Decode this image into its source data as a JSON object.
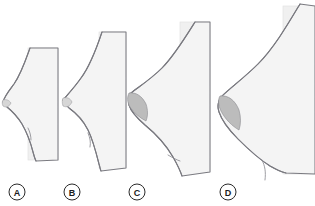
{
  "figure": {
    "width": 315,
    "height": 206,
    "background_color": "#ffffff"
  },
  "colors": {
    "panel_fill": "#f0f0f0",
    "panel_edge": "#e2e2e2",
    "contour_fill": "#f4f4f4",
    "contour_stroke": "#7a7a80",
    "areola_fill": "#bcbcbc",
    "areola_faint_fill": "#d6d6d6",
    "label_stroke": "#2a2a2a",
    "label_text": "#1c1c1c"
  },
  "labels": [
    {
      "id": "A",
      "text": "A",
      "cx": 17,
      "cy": 192,
      "r": 8
    },
    {
      "id": "B",
      "text": "B",
      "cx": 72,
      "cy": 192,
      "r": 8
    },
    {
      "id": "C",
      "text": "C",
      "cx": 137,
      "cy": 192,
      "r": 8
    },
    {
      "id": "D",
      "text": "D",
      "cx": 228,
      "cy": 192,
      "r": 8
    }
  ],
  "figures": [
    {
      "id": "A",
      "label": "A",
      "name": "breast-profile-a",
      "size_rank": 1,
      "projection": "minimal",
      "areola_shading": "very-faint",
      "panel": {
        "x": 28,
        "y": 48,
        "width": 30,
        "height": 112
      },
      "contour_path": "M 30 48 C 25 62 21 74 14 84 C 8 92 4 97 3 102 C 4 104 5 105 7 107 C 12 111 17 116 22 124 C 26 131 30 140 33 152 C 34 156 35 159 36 161",
      "areola_path": "M 3 100 C 6 99 9 100 11 103 C 9 107 6 108 3 106 C 2 104 2 102 3 100 Z",
      "fold_path": "M 28 128 C 30 132 31 136 31 140"
    },
    {
      "id": "B",
      "label": "B",
      "name": "breast-profile-b",
      "size_rank": 2,
      "projection": "small",
      "areola_shading": "faint",
      "panel": {
        "x": 99,
        "y": 32,
        "width": 27,
        "height": 136
      },
      "contour_path": "M 102 32 C 96 50 90 66 81 78 C 74 88 68 94 63 100 C 64 103 66 105 69 108 C 76 113 83 120 88 130 C 93 140 96 152 99 164 C 100 167 100 169 101 171",
      "areola_path": "M 63 98 C 67 97 70 98 72 102 C 70 106 67 108 63 106 C 62 103 62 100 63 98 Z",
      "fold_path": "M 88 133 C 90 138 91 142 90 147"
    },
    {
      "id": "C",
      "label": "C",
      "name": "breast-profile-c",
      "size_rank": 3,
      "projection": "moderate",
      "areola_shading": "pronounced",
      "panel": {
        "x": 180,
        "y": 22,
        "width": 30,
        "height": 150
      },
      "contour_path": "M 195 22 C 185 38 174 56 162 68 C 151 79 140 86 131 93 C 129 96 128 100 129 105 C 131 112 137 118 145 125 C 156 134 166 145 173 157 C 177 164 180 170 182 176",
      "areola_path": "M 129 93 C 136 92 142 96 146 104 C 148 110 148 116 146 121 C 140 118 134 113 130 107 C 127 102 127 97 129 93 Z",
      "fold_path": "M 168 155 C 173 158 177 160 180 161"
    },
    {
      "id": "D",
      "label": "D",
      "name": "breast-profile-d",
      "size_rank": 4,
      "projection": "large",
      "areola_shading": "pronounced",
      "panel": {
        "x": 283,
        "y": 6,
        "width": 32,
        "height": 168
      },
      "contour_path": "M 300 4 C 288 24 274 48 258 64 C 244 78 230 88 221 97 C 218 101 217 106 219 112 C 222 121 229 130 238 139 C 250 151 262 161 270 166 C 277 170 282 172 286 173",
      "areola_path": "M 220 96 C 228 95 235 100 239 110 C 241 117 241 124 239 130 C 232 126 225 119 221 111 C 218 105 218 99 220 96 Z",
      "fold_path": "M 262 160 C 265 166 266 172 265 180"
    }
  ]
}
